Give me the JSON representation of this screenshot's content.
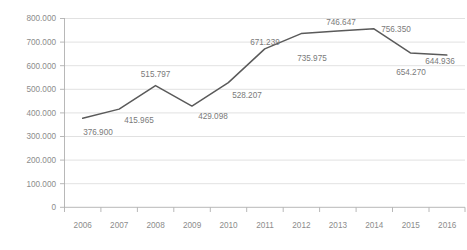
{
  "chart_data": {
    "type": "line",
    "title": "",
    "subtitle": "",
    "xlabel": "",
    "ylabel": "",
    "categories": [
      "2006",
      "2007",
      "2008",
      "2009",
      "2010",
      "2011",
      "2012",
      "2013",
      "2014",
      "2015",
      "2016"
    ],
    "values": [
      376.9,
      415.965,
      515.797,
      429.098,
      528.207,
      671.239,
      735.975,
      746.647,
      756.35,
      654.27,
      644.936
    ],
    "point_labels": [
      "376.900",
      "415.965",
      "515.797",
      "429.098",
      "528.207",
      "671.239",
      "735.975",
      "746.647",
      "756.350",
      "654.270",
      "644.936"
    ],
    "ylim": [
      0,
      800
    ],
    "ytick_values": [
      0,
      100,
      200,
      300,
      400,
      500,
      600,
      700,
      800
    ],
    "ytick_labels": [
      "0",
      "100.000",
      "200.000",
      "300.000",
      "400.000",
      "500.000",
      "600.000",
      "700.000",
      "800.000"
    ],
    "grid": true,
    "legend": "none",
    "series": [
      {
        "name": "",
        "color": "#5a5a5a",
        "values": [
          376.9,
          415.965,
          515.797,
          429.098,
          528.207,
          671.239,
          735.975,
          746.647,
          756.35,
          654.27,
          644.936
        ]
      }
    ],
    "colors": {
      "line": "#5a5a5a",
      "grid": "#d9d9d9",
      "axis": "#b0b0b0",
      "tick_text": "#8c8c8c",
      "label_text": "#7a7a7a",
      "background": "#ffffff"
    }
  },
  "axes": {
    "y": {
      "t0": "0",
      "t1": "100.000",
      "t2": "200.000",
      "t3": "300.000",
      "t4": "400.000",
      "t5": "500.000",
      "t6": "600.000",
      "t7": "700.000",
      "t8": "800.000"
    },
    "x": {
      "c0": "2006",
      "c1": "2007",
      "c2": "2008",
      "c3": "2009",
      "c4": "2010",
      "c5": "2011",
      "c6": "2012",
      "c7": "2013",
      "c8": "2014",
      "c9": "2015",
      "c10": "2016"
    }
  },
  "labels": {
    "p0": "376.900",
    "p1": "415.965",
    "p2": "515.797",
    "p3": "429.098",
    "p4": "528.207",
    "p5": "671.239",
    "p6": "735.975",
    "p7": "746.647",
    "p8": "756.350",
    "p9": "654.270",
    "p10": "644.936"
  }
}
